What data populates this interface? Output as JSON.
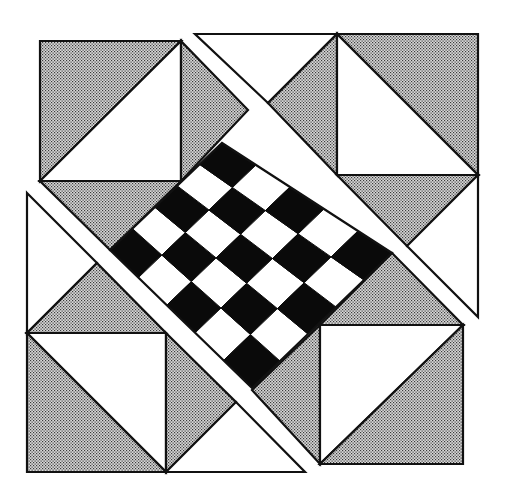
{
  "diagram": {
    "title": "Quilt block: checkerboard diamond with half-square triangle corners",
    "width": 505,
    "height": 491,
    "colors": {
      "background": "#ffffff",
      "stroke": "#111111",
      "dark": "#0a0a0a",
      "light": "#ffffff",
      "stipple_bg": "#d8d8d8",
      "stipple_dot": "#3a3a3a"
    },
    "stroke_width": 2.2,
    "pieces": [
      {
        "name": "tl-square-stipple",
        "fill": "stipple",
        "points": [
          [
            40,
            41
          ],
          [
            181,
            41
          ],
          [
            40,
            181
          ]
        ]
      },
      {
        "name": "tl-square-white",
        "fill": "white",
        "points": [
          [
            181,
            41
          ],
          [
            181,
            181
          ],
          [
            40,
            181
          ]
        ]
      },
      {
        "name": "tl-right-triangle",
        "fill": "stipple",
        "points": [
          [
            181,
            41
          ],
          [
            248,
            110
          ],
          [
            181,
            181
          ]
        ]
      },
      {
        "name": "tl-bottom-triangle",
        "fill": "stipple",
        "points": [
          [
            40,
            181
          ],
          [
            181,
            181
          ],
          [
            110,
            250
          ]
        ]
      },
      {
        "name": "top-white-triangle",
        "fill": "white",
        "points": [
          [
            195,
            34
          ],
          [
            337,
            34
          ],
          [
            268,
            103
          ]
        ]
      },
      {
        "name": "tr-left-triangle",
        "fill": "stipple",
        "points": [
          [
            337,
            34
          ],
          [
            337,
            175
          ],
          [
            268,
            103
          ]
        ]
      },
      {
        "name": "tr-square-stipple",
        "fill": "stipple",
        "points": [
          [
            337,
            34
          ],
          [
            478,
            34
          ],
          [
            478,
            175
          ]
        ]
      },
      {
        "name": "tr-square-white",
        "fill": "white",
        "points": [
          [
            337,
            34
          ],
          [
            478,
            175
          ],
          [
            337,
            175
          ]
        ]
      },
      {
        "name": "tr-bottom-triangle",
        "fill": "stipple",
        "points": [
          [
            337,
            175
          ],
          [
            478,
            175
          ],
          [
            407,
            246
          ]
        ]
      },
      {
        "name": "right-white-triangle",
        "fill": "white",
        "points": [
          [
            478,
            175
          ],
          [
            478,
            317
          ],
          [
            407,
            246
          ]
        ]
      },
      {
        "name": "left-white-triangle",
        "fill": "white",
        "points": [
          [
            27,
            193
          ],
          [
            97,
            263
          ],
          [
            27,
            333
          ]
        ]
      },
      {
        "name": "bl-top-triangle",
        "fill": "stipple",
        "points": [
          [
            27,
            333
          ],
          [
            97,
            263
          ],
          [
            166,
            333
          ]
        ]
      },
      {
        "name": "bl-square-white",
        "fill": "white",
        "points": [
          [
            27,
            333
          ],
          [
            166,
            333
          ],
          [
            166,
            472
          ]
        ]
      },
      {
        "name": "bl-square-stipple",
        "fill": "stipple",
        "points": [
          [
            27,
            333
          ],
          [
            166,
            472
          ],
          [
            27,
            472
          ]
        ]
      },
      {
        "name": "bl-right-triangle",
        "fill": "stipple",
        "points": [
          [
            166,
            333
          ],
          [
            236,
            402
          ],
          [
            166,
            472
          ]
        ]
      },
      {
        "name": "bottom-white-triangle",
        "fill": "white",
        "points": [
          [
            166,
            472
          ],
          [
            236,
            402
          ],
          [
            305,
            472
          ]
        ]
      },
      {
        "name": "br-top-triangle",
        "fill": "stipple",
        "points": [
          [
            320,
            325
          ],
          [
            392,
            253
          ],
          [
            463,
            325
          ]
        ]
      },
      {
        "name": "br-left-triangle",
        "fill": "stipple",
        "points": [
          [
            320,
            325
          ],
          [
            320,
            464
          ],
          [
            252,
            390
          ]
        ]
      },
      {
        "name": "br-square-white",
        "fill": "white",
        "points": [
          [
            320,
            325
          ],
          [
            463,
            325
          ],
          [
            320,
            464
          ]
        ]
      },
      {
        "name": "br-square-stipple",
        "fill": "stipple",
        "points": [
          [
            463,
            325
          ],
          [
            463,
            464
          ],
          [
            320,
            464
          ]
        ]
      }
    ],
    "checkerboard": {
      "rows": 5,
      "cols": 5,
      "corner_left": [
        110,
        250
      ],
      "corner_top": [
        222,
        143
      ],
      "corner_right": [
        392,
        253
      ],
      "corner_bottom": [
        252,
        388
      ],
      "pattern_note": "cell (i,j) is dark when (i+j) is even",
      "dark_parity": 0
    },
    "strips": [
      {
        "name": "upper-diagonal-strip",
        "points": [
          [
            195,
            34
          ],
          [
            208,
            34
          ],
          [
            470,
            300
          ],
          [
            478,
            317
          ]
        ]
      },
      {
        "name": "lower-diagonal-strip",
        "points": [
          [
            27,
            193
          ],
          [
            27,
            208
          ],
          [
            290,
            472
          ],
          [
            305,
            472
          ]
        ]
      }
    ]
  }
}
